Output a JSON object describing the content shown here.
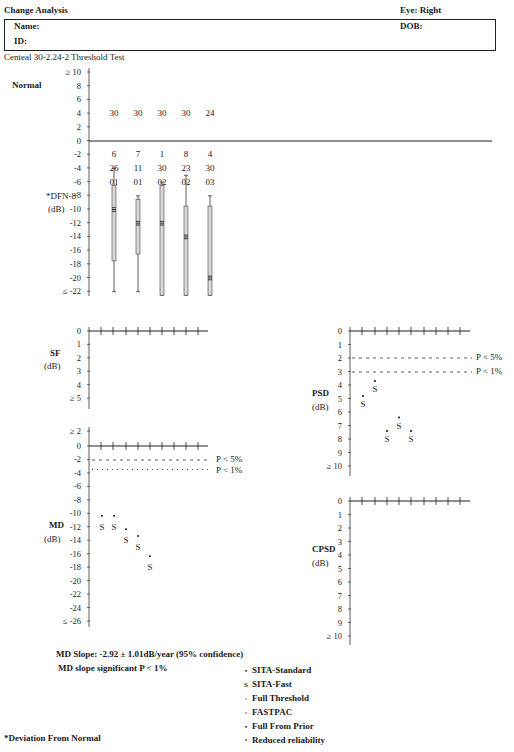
{
  "header": {
    "title": "Change Analysis",
    "eye_label": "Eye: Right",
    "name_label": "Name:",
    "dob_label": "DOB:",
    "id_label": "ID:",
    "test_name": "Centeal 30-2.24-2 Threshold Test"
  },
  "dfn_panel": {
    "normal_label": "Normal",
    "axis_label_line1": "*DFN-8",
    "axis_label_line2": "(dB)",
    "footnote": "*Deviation From Normal"
  },
  "sf_panel": {
    "label": "SF",
    "unit": "(dB)"
  },
  "md_panel": {
    "label": "MD",
    "unit": "(dB)",
    "p5_label": "P < 5%",
    "p1_label": "P < 1%",
    "slope_text": "MD Slope: -2.92 ± 1.01dB/year (95% confidence)",
    "significance_text": "MD slope significant P < 1%"
  },
  "psd_panel": {
    "label": "PSD",
    "unit": "(dB)",
    "p5_label": "P < 5%",
    "p1_label": "P < 1%"
  },
  "cpsd_panel": {
    "label": "CPSD",
    "unit": "(dB)"
  },
  "legend": {
    "items": [
      {
        "symbol": "•",
        "label": "SITA-Standard"
      },
      {
        "symbol": "S",
        "label": "SITA-Fast"
      },
      {
        "symbol": "◦",
        "label": "Full Threshold"
      },
      {
        "symbol": "▫",
        "label": "FASTPAC"
      },
      {
        "symbol": "•",
        "label": "Full From Prior"
      },
      {
        "symbol": "ˣ",
        "label": "Reduced reliability"
      }
    ]
  },
  "chart_data": [
    {
      "type": "box",
      "title": "Deviation From Normal (DFN) box plots",
      "ylabel": "*DFN (dB)",
      "ylim": [
        -22,
        10
      ],
      "yticks": [
        "≥ 10",
        "8",
        "6",
        "4",
        "2",
        "0",
        "-2",
        "-4",
        "-6",
        "-8",
        "-10",
        "-12",
        "-14",
        "-16",
        "-18",
        "-20",
        "≤ -22"
      ],
      "normal_row": [
        30,
        30,
        30,
        30,
        24
      ],
      "row_a": [
        6,
        7,
        1,
        8,
        4
      ],
      "row_b": [
        26,
        11,
        30,
        23,
        30
      ],
      "row_c": [
        "01",
        "01",
        "02",
        "02",
        "03"
      ],
      "boxes": [
        {
          "whisker_top": -4,
          "box_top": -6.5,
          "median": -10,
          "box_bottom": -17.5,
          "whisker_bottom": -22
        },
        {
          "whisker_top": -8,
          "box_top": -8.5,
          "median": -12,
          "box_bottom": -16.5,
          "whisker_bottom": -22
        },
        {
          "whisker_top": -6,
          "box_top": -6.5,
          "median": -12,
          "box_bottom": -22.5,
          "whisker_bottom": -22.5
        },
        {
          "whisker_top": -5,
          "box_top": -9.5,
          "median": -14,
          "box_bottom": -22.5,
          "whisker_bottom": -22.5
        },
        {
          "whisker_top": -8,
          "box_top": -9.5,
          "median": -20,
          "box_bottom": -22.5,
          "whisker_bottom": -22.5
        }
      ]
    },
    {
      "type": "scatter",
      "title": "SF",
      "ylabel": "SF (dB)",
      "ylim": [
        0,
        5
      ],
      "yticks": [
        "0",
        "1",
        "2",
        "3",
        "4",
        "≥ 5"
      ],
      "points": []
    },
    {
      "type": "scatter",
      "title": "MD",
      "ylabel": "MD (dB)",
      "ylim": [
        -26,
        2
      ],
      "yticks": [
        "≥ 2",
        "0",
        "-2",
        "-4",
        "-6",
        "-8",
        "-10",
        "-12",
        "-14",
        "-16",
        "-18",
        "-20",
        "-22",
        "-24",
        "≤ -26"
      ],
      "reference_lines": [
        {
          "y": -2,
          "label": "P < 5%"
        },
        {
          "y": -3.5,
          "label": "P < 1%"
        }
      ],
      "points": [
        {
          "x": 1,
          "y": -12,
          "symbol": "S"
        },
        {
          "x": 2,
          "y": -12,
          "symbol": "S"
        },
        {
          "x": 3,
          "y": -14,
          "symbol": "S"
        },
        {
          "x": 4,
          "y": -15,
          "symbol": "S"
        },
        {
          "x": 5,
          "y": -18,
          "symbol": "S"
        }
      ]
    },
    {
      "type": "scatter",
      "title": "PSD",
      "ylabel": "PSD (dB)",
      "ylim": [
        0,
        10
      ],
      "yticks": [
        "0",
        "1",
        "2",
        "3",
        "4",
        "5",
        "6",
        "7",
        "8",
        "9",
        "≥ 10"
      ],
      "reference_lines": [
        {
          "y": 2,
          "label": "P < 5%"
        },
        {
          "y": 3,
          "label": "P < 1%"
        }
      ],
      "points": [
        {
          "x": 1,
          "y": 5.4,
          "symbol": "S"
        },
        {
          "x": 2,
          "y": 4.3,
          "symbol": "S"
        },
        {
          "x": 3,
          "y": 8,
          "symbol": "S"
        },
        {
          "x": 4,
          "y": 7,
          "symbol": "S"
        },
        {
          "x": 5,
          "y": 8,
          "symbol": "S"
        }
      ]
    },
    {
      "type": "scatter",
      "title": "CPSD",
      "ylabel": "CPSD (dB)",
      "ylim": [
        0,
        10
      ],
      "yticks": [
        "0",
        "1",
        "2",
        "3",
        "4",
        "5",
        "6",
        "7",
        "8",
        "9",
        "≥ 10"
      ],
      "points": []
    }
  ]
}
